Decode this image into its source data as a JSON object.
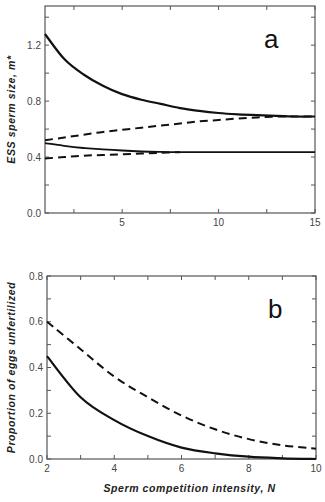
{
  "chart_data": [
    {
      "type": "line",
      "panel": "a",
      "title": "",
      "panel_label": "a",
      "xlabel": "",
      "ylabel": "ESS sperm size, m*",
      "xlim": [
        1,
        15
      ],
      "ylim": [
        0,
        1.48
      ],
      "x_ticks": [
        5,
        10,
        15
      ],
      "x_tick_labels": [
        "5",
        "10",
        "15"
      ],
      "y_ticks": [
        0.0,
        0.4,
        0.8,
        1.2
      ],
      "y_tick_labels": [
        "0.0",
        "0.4",
        "0.8",
        "1.2"
      ],
      "grid": false,
      "legend": null,
      "x": [
        1,
        2,
        3,
        4,
        5,
        6,
        7,
        8,
        9,
        10,
        11,
        12,
        13,
        14,
        15
      ],
      "series": [
        {
          "name": "upper solid",
          "style": "solid",
          "values": [
            1.28,
            1.1,
            0.99,
            0.91,
            0.85,
            0.81,
            0.78,
            0.75,
            0.73,
            0.715,
            0.705,
            0.7,
            0.695,
            0.69,
            0.69
          ]
        },
        {
          "name": "upper dashed",
          "style": "dashed",
          "values": [
            0.52,
            0.54,
            0.56,
            0.58,
            0.595,
            0.61,
            0.625,
            0.64,
            0.655,
            0.665,
            0.675,
            0.683,
            0.69,
            0.69,
            0.69
          ]
        },
        {
          "name": "lower solid",
          "style": "solid",
          "values": [
            0.5,
            0.48,
            0.465,
            0.455,
            0.447,
            0.44,
            0.437,
            0.435,
            0.435,
            0.435,
            0.435,
            0.435,
            0.435,
            0.435,
            0.435
          ]
        },
        {
          "name": "lower dashed",
          "style": "dashed",
          "values": [
            0.39,
            0.4,
            0.41,
            0.415,
            0.42,
            0.425,
            0.43,
            0.435,
            null,
            null,
            null,
            null,
            null,
            null,
            null
          ]
        }
      ]
    },
    {
      "type": "line",
      "panel": "b",
      "title": "",
      "panel_label": "b",
      "xlabel": "Sperm competition intensity, N",
      "ylabel": "Proportion of eggs unfertilized",
      "xlim": [
        2,
        10
      ],
      "ylim": [
        0,
        0.8
      ],
      "x_ticks": [
        2,
        4,
        6,
        8,
        10
      ],
      "x_tick_labels": [
        "2",
        "4",
        "6",
        "8",
        "10"
      ],
      "y_ticks": [
        0.0,
        0.2,
        0.4,
        0.6,
        0.8
      ],
      "y_tick_labels": [
        "0.0",
        "0.2",
        "0.4",
        "0.6",
        "0.8"
      ],
      "grid": false,
      "legend": null,
      "x": [
        2,
        3,
        4,
        5,
        6,
        7,
        8,
        9,
        10
      ],
      "series": [
        {
          "name": "dashed",
          "style": "dashed",
          "values": [
            0.6,
            0.48,
            0.36,
            0.27,
            0.19,
            0.13,
            0.087,
            0.06,
            0.045
          ]
        },
        {
          "name": "solid",
          "style": "solid",
          "values": [
            0.45,
            0.27,
            0.17,
            0.1,
            0.05,
            0.025,
            0.01,
            0.003,
            0.0
          ]
        }
      ]
    }
  ]
}
